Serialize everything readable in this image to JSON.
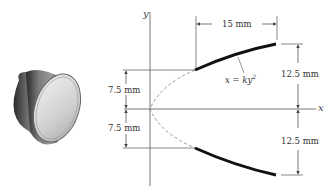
{
  "figure": {
    "object": "truncated-cone-nozzle",
    "axes": {
      "x_label": "x",
      "y_label": "y"
    },
    "equation": "x = ky",
    "equation_exponent": "2",
    "dimensions": {
      "horizontal_length": "15 mm",
      "inner_upper": "7.5 mm",
      "inner_lower": "7.5 mm",
      "outer_upper": "12.5 mm",
      "outer_lower": "12.5 mm"
    },
    "colors": {
      "line": "#555555",
      "curve": "#111111",
      "dashed": "#888888"
    }
  }
}
